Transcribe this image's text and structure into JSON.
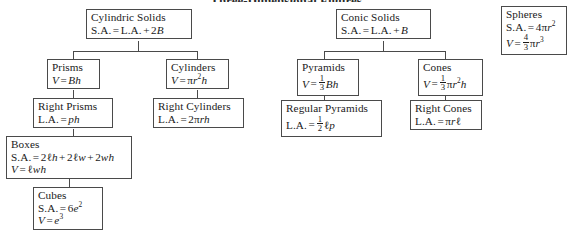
{
  "diagram": {
    "title": "Three-Dimensional Figures",
    "type": "hierarchy-tree",
    "branches": [
      {
        "id": "cylindric",
        "root": "Cylindric Solids",
        "nodes": [
          {
            "id": "cylindric-solids",
            "label": "Cylindric Solids",
            "formulas": [
              "S.A. = L.A. + 2B"
            ]
          },
          {
            "id": "prisms",
            "label": "Prisms",
            "formulas": [
              "V = Bh"
            ]
          },
          {
            "id": "cylinders",
            "label": "Cylinders",
            "formulas": [
              "V = πr²h"
            ]
          },
          {
            "id": "right-prisms",
            "label": "Right Prisms",
            "formulas": [
              "L.A. = ph"
            ]
          },
          {
            "id": "right-cylinders",
            "label": "Right Cylinders",
            "formulas": [
              "L.A. = 2πrh"
            ]
          },
          {
            "id": "boxes",
            "label": "Boxes",
            "formulas": [
              "S.A. = 2ℓh + 2ℓw + 2wh",
              "V = ℓwh"
            ]
          },
          {
            "id": "cubes",
            "label": "Cubes",
            "formulas": [
              "S.A. = 6e²",
              "V = e³"
            ]
          }
        ]
      },
      {
        "id": "conic",
        "root": "Conic Solids",
        "nodes": [
          {
            "id": "conic-solids",
            "label": "Conic Solids",
            "formulas": [
              "S.A. = L.A. + B"
            ]
          },
          {
            "id": "pyramids",
            "label": "Pyramids",
            "formulas": [
              "V = ⅓Bh"
            ]
          },
          {
            "id": "cones",
            "label": "Cones",
            "formulas": [
              "V = ⅓πr²h"
            ]
          },
          {
            "id": "regular-pyramids",
            "label": "Regular Pyramids",
            "formulas": [
              "L.A. = ½ℓp"
            ]
          },
          {
            "id": "right-cones",
            "label": "Right Cones",
            "formulas": [
              "L.A. = πrℓ"
            ]
          }
        ]
      },
      {
        "id": "spheres",
        "root": "Spheres",
        "nodes": [
          {
            "id": "spheres",
            "label": "Spheres",
            "formulas": [
              "S.A. = 4πr²",
              "V = ⁴⁄₃πr³"
            ]
          }
        ]
      }
    ],
    "labels": {
      "cylindric_solids": "Cylindric Solids",
      "prisms": "Prisms",
      "cylinders": "Cylinders",
      "right_prisms": "Right Prisms",
      "right_cylinders": "Right Cylinders",
      "boxes": "Boxes",
      "cubes": "Cubes",
      "conic_solids": "Conic Solids",
      "pyramids": "Pyramids",
      "cones": "Cones",
      "regular_pyramids": "Regular Pyramids",
      "right_cones": "Right Cones",
      "spheres": "Spheres"
    },
    "colors": {
      "border": "#4a4a4a",
      "background": "#ffffff",
      "text": "#1a1a1a"
    }
  }
}
